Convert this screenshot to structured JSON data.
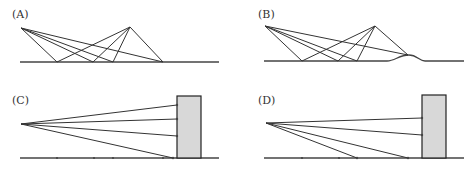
{
  "panels": [
    {
      "label": "(A)",
      "type": "reflection-flat-ground",
      "label_pos": [
        12,
        18
      ],
      "source": [
        21,
        28
      ],
      "apex": [
        130,
        27
      ],
      "ground": {
        "y": 62,
        "x1": 20,
        "x2": 219
      },
      "reflection_points_x": [
        57,
        93,
        113,
        163
      ]
    },
    {
      "label": "(B)",
      "type": "reflection-ground-with-bump",
      "label_pos": [
        258,
        18
      ],
      "source": [
        265,
        26
      ],
      "apex": [
        375,
        26
      ],
      "ground": {
        "y": 61,
        "x1": 264,
        "x2": 464
      },
      "bump": {
        "x1": 387,
        "peak_x": 409,
        "peak_y": 55,
        "x2": 425
      },
      "reflection_points_x": [
        302,
        338,
        357,
        408
      ]
    },
    {
      "label": "(C)",
      "type": "rays-to-wall",
      "label_pos": [
        12,
        104
      ],
      "source": [
        21,
        124
      ],
      "ground": {
        "y": 158,
        "x1": 20,
        "x2": 219
      },
      "wall": {
        "x": 177,
        "y": 96,
        "width": 24,
        "height": 62
      },
      "wall_hits_y": [
        105,
        119,
        136
      ],
      "ground_hits_x": [
        173
      ],
      "ground_ticks_x": [
        57,
        94,
        113,
        163
      ]
    },
    {
      "label": "(D)",
      "type": "rays-to-wall",
      "label_pos": [
        258,
        104
      ],
      "source": [
        266,
        123
      ],
      "ground": {
        "y": 158,
        "x1": 264,
        "x2": 464
      },
      "wall": {
        "x": 422,
        "y": 95,
        "width": 24,
        "height": 63
      },
      "wall_hits_y": [
        118,
        135
      ],
      "ground_hits_x": [
        357,
        408
      ],
      "ground_ticks_x": [
        302,
        339
      ]
    }
  ]
}
